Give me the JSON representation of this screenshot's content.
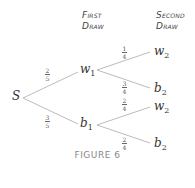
{
  "headers": {
    "first": [
      "First",
      "Draw"
    ],
    "second": [
      "Second",
      "Draw"
    ]
  },
  "nodes": {
    "root": "S",
    "w1": {
      "base": "w",
      "sub": "1"
    },
    "b1": {
      "base": "b",
      "sub": "1"
    },
    "w2a": {
      "base": "w",
      "sub": "2"
    },
    "b2a": {
      "base": "b",
      "sub": "2"
    },
    "w2b": {
      "base": "w",
      "sub": "2"
    },
    "b2b": {
      "base": "b",
      "sub": "2"
    }
  },
  "edges": {
    "s_w1": {
      "num": "2",
      "den": "5"
    },
    "s_b1": {
      "num": "3",
      "den": "5"
    },
    "w1_w2": {
      "num": "1",
      "den": "4"
    },
    "w1_b2": {
      "num": "3",
      "den": "4"
    },
    "b1_w2": {
      "num": "2",
      "den": "4"
    },
    "b1_b2": {
      "num": "2",
      "den": "4"
    }
  },
  "caption": "FIGURE 6",
  "colors": {
    "line": "#aaaaaa",
    "text": "#333333",
    "caption": "#888888"
  }
}
